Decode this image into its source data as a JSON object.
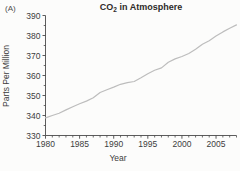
{
  "figure": {
    "panel_label": "(A)",
    "title": {
      "base": "CO",
      "sub": "2",
      "rest": " in Atmosphere"
    }
  },
  "chart_data": {
    "type": "line",
    "title": "CO2 in Atmosphere",
    "xlabel": "Year",
    "ylabel": "Parts Per Million",
    "x": [
      1980,
      1981,
      1982,
      1983,
      1984,
      1985,
      1986,
      1987,
      1988,
      1989,
      1990,
      1991,
      1992,
      1993,
      1994,
      1995,
      1996,
      1997,
      1998,
      1999,
      2000,
      2001,
      2002,
      2003,
      2004,
      2005,
      2006,
      2007,
      2008
    ],
    "values": [
      338.8,
      340.0,
      341.1,
      342.8,
      344.4,
      345.9,
      347.2,
      348.9,
      351.5,
      352.9,
      354.2,
      355.6,
      356.4,
      357.0,
      358.9,
      360.9,
      362.6,
      363.8,
      366.6,
      368.3,
      369.5,
      371.0,
      373.1,
      375.6,
      377.4,
      379.7,
      381.8,
      383.6,
      385.3
    ],
    "xlim": [
      1980,
      2008
    ],
    "ylim": [
      330,
      390
    ],
    "xticks_major": [
      1980,
      1985,
      1990,
      1995,
      2000,
      2005
    ],
    "xticks_minor_step": 1,
    "yticks_major": [
      330,
      340,
      350,
      360,
      370,
      380,
      390
    ],
    "yticks_minor_step": 5,
    "grid": false,
    "legend": false,
    "line_color": "#bdbdbd",
    "axis_color": "#4a4a4a",
    "tick_text_color": "#3d3d3d",
    "background_color": "#fcfcfb"
  }
}
